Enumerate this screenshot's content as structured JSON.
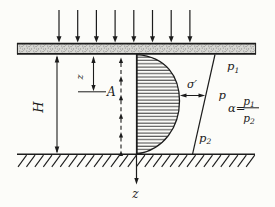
{
  "figure": {
    "background": "#fcfcf9",
    "ink": "#1c1c1c",
    "load": {
      "arrow_count": 8
    },
    "flow": {
      "arrow_count": 6
    },
    "labels": {
      "height": "H",
      "depth": "z",
      "point": "A",
      "effective_stress": "σ′",
      "pressure_mid": "p",
      "pressure_top": {
        "base": "p",
        "sub": "1"
      },
      "pressure_line_bottom": {
        "base": "p",
        "sub": "2"
      },
      "alpha": {
        "lhs": "α=",
        "numerator": {
          "base": "p",
          "sub": "1"
        },
        "denominator": {
          "base": "p",
          "sub": "2"
        }
      },
      "z_axis": "z"
    }
  }
}
